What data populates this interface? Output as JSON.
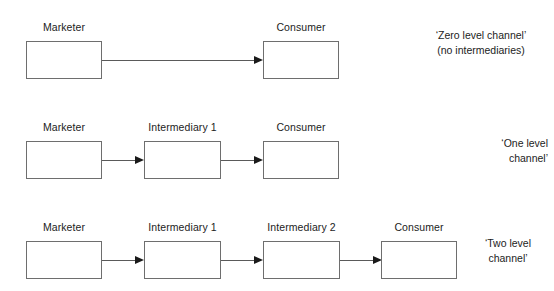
{
  "diagram": {
    "type": "flow",
    "box_border_color": "#6e6e6e",
    "line_color": "#5a5a5a",
    "arrow_color": "#1a1a1a",
    "text_color": "#1c1c1c",
    "background": "#ffffff",
    "rows": [
      {
        "id": "zero-level",
        "nodes": [
          {
            "label": "Marketer"
          },
          {
            "label": "Consumer"
          }
        ],
        "note_lines": [
          "‘Zero level channel’",
          "(no intermediaries)"
        ]
      },
      {
        "id": "one-level",
        "nodes": [
          {
            "label": "Marketer"
          },
          {
            "label": "Intermediary 1"
          },
          {
            "label": "Consumer"
          }
        ],
        "note_lines": [
          "‘One level",
          "channel’"
        ]
      },
      {
        "id": "two-level",
        "nodes": [
          {
            "label": "Marketer"
          },
          {
            "label": "Intermediary 1"
          },
          {
            "label": "Intermediary 2"
          },
          {
            "label": "Consumer"
          }
        ],
        "note_lines": [
          "‘Two level",
          "channel’"
        ]
      }
    ]
  }
}
